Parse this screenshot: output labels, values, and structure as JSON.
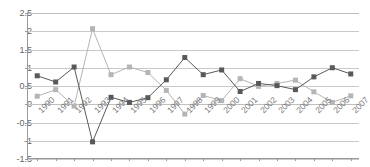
{
  "title_remnant": "· · ·   · · ·   · · · · · · · · · ·   · · · · ·   · ·",
  "colors": {
    "series_dark": "#595959",
    "series_light": "#b5b5b5",
    "gridline": "#c9c9c9",
    "axis": "#9a9a9a",
    "tick_text": "#666666"
  },
  "chart_data": {
    "type": "line",
    "title": "",
    "xlabel": "",
    "ylabel": "",
    "ylim": [
      -1.5,
      2.5
    ],
    "yticks": [
      "2.5",
      "2",
      "1.5",
      "1",
      "0.5",
      "0",
      "-0.5",
      "-1",
      "-1.5"
    ],
    "ytick_values": [
      2.5,
      2,
      1.5,
      1,
      0.5,
      0,
      -0.5,
      -1,
      -1.5
    ],
    "grid": true,
    "legend": "none",
    "categories": [
      "1990",
      "1991",
      "1992",
      "1993",
      "1994",
      "1995",
      "1996",
      "1997",
      "1998",
      "1999",
      "2000",
      "2001",
      "2002",
      "2003",
      "2004",
      "2005",
      "2006",
      "2007"
    ],
    "series": [
      {
        "name": "Series 1",
        "color": "#595959",
        "marker": "square",
        "values": [
          0.78,
          0.61,
          1.02,
          -1.03,
          0.19,
          0.05,
          0.18,
          0.67,
          1.28,
          0.81,
          0.94,
          0.35,
          0.57,
          0.51,
          0.4,
          0.75,
          1.0,
          0.83
        ]
      },
      {
        "name": "Series 2",
        "color": "#b5b5b5",
        "marker": "square",
        "values": [
          0.22,
          0.4,
          -0.05,
          2.07,
          0.81,
          1.02,
          0.87,
          0.38,
          -0.27,
          0.24,
          0.1,
          0.7,
          0.49,
          0.57,
          0.66,
          0.34,
          0.05,
          0.23
        ]
      }
    ]
  }
}
